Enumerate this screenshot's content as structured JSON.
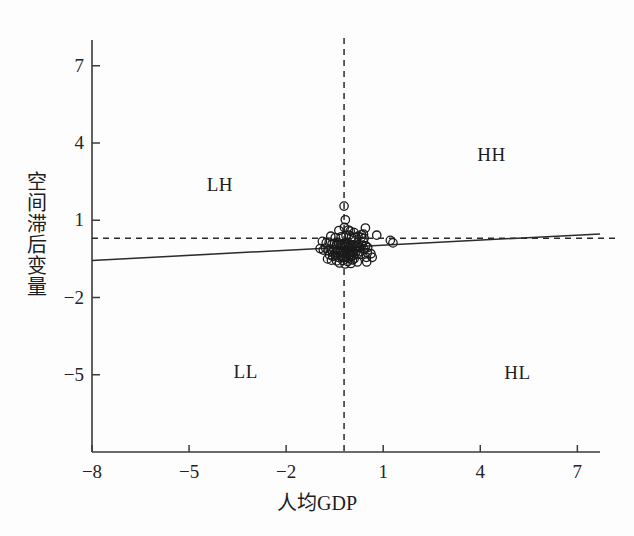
{
  "figure": {
    "background_color": "#fdfdfd",
    "axis_color": "#3a3a3a",
    "point_color": "#1a1a1a",
    "fit_line_color": "#2b2b2b",
    "mean_line_color": "#2b2b2b"
  },
  "chart_data": {
    "type": "scatter",
    "title": "",
    "xlabel": "人均GDP",
    "ylabel": "空间滞后变量",
    "xlim": [
      -8.0,
      7.7
    ],
    "ylim": [
      -8.0,
      8.0
    ],
    "xticks": [
      -8,
      -5,
      -2,
      1,
      4,
      7
    ],
    "xticklabels": [
      "−8",
      "−5",
      "−2",
      "1",
      "4",
      "7"
    ],
    "yticks": [
      7,
      4,
      1,
      -2,
      -5
    ],
    "yticklabels": [
      "7",
      "4",
      "1",
      "−2",
      "−5"
    ],
    "grid": false,
    "legend": null,
    "annotations": [
      {
        "text": "LH",
        "x": -4.05,
        "y": 2.38,
        "name": "quadrant-label-lh"
      },
      {
        "text": "HH",
        "x": 4.35,
        "y": 3.52,
        "name": "quadrant-label-hh"
      },
      {
        "text": "LL",
        "x": -3.25,
        "y": -4.88,
        "name": "quadrant-label-ll"
      },
      {
        "text": "HL",
        "x": 5.15,
        "y": -4.95,
        "name": "quadrant-label-hl"
      }
    ],
    "reference_lines": [
      {
        "orientation": "vertical",
        "value": -0.21,
        "style": "dashed",
        "name": "mean-x-line"
      },
      {
        "orientation": "horizontal",
        "value": 0.3,
        "style": "dashed",
        "name": "mean-y-line"
      }
    ],
    "fit_line": {
      "style": "solid",
      "x": [
        -8.0,
        7.7
      ],
      "y": [
        -0.56,
        0.47
      ],
      "slope": 0.0656,
      "intercept": -0.035
    },
    "marker": {
      "shape": "circle-open",
      "radius_px": 4.2,
      "edge_width_px": 1.3
    },
    "points": [
      [
        -0.21,
        1.55
      ],
      [
        -0.17,
        1.02
      ],
      [
        -0.2,
        0.72
      ],
      [
        -0.37,
        0.6
      ],
      [
        -0.08,
        0.62
      ],
      [
        -0.02,
        0.58
      ],
      [
        0.1,
        0.52
      ],
      [
        0.45,
        0.7
      ],
      [
        0.39,
        0.46
      ],
      [
        0.33,
        0.44
      ],
      [
        -0.62,
        0.38
      ],
      [
        -0.48,
        0.33
      ],
      [
        -0.3,
        0.36
      ],
      [
        -0.15,
        0.4
      ],
      [
        -0.05,
        0.42
      ],
      [
        0.02,
        0.35
      ],
      [
        0.12,
        0.33
      ],
      [
        0.22,
        0.38
      ],
      [
        0.32,
        0.34
      ],
      [
        0.41,
        0.3
      ],
      [
        0.8,
        0.42
      ],
      [
        1.22,
        0.22
      ],
      [
        1.3,
        0.12
      ],
      [
        -0.88,
        0.18
      ],
      [
        -0.76,
        0.12
      ],
      [
        -0.67,
        0.14
      ],
      [
        -0.58,
        0.08
      ],
      [
        -0.5,
        0.1
      ],
      [
        -0.44,
        0.05
      ],
      [
        -0.38,
        0.12
      ],
      [
        -0.33,
        0.02
      ],
      [
        -0.28,
        0.08
      ],
      [
        -0.24,
        0.0
      ],
      [
        -0.2,
        0.1
      ],
      [
        -0.16,
        0.04
      ],
      [
        -0.12,
        -0.02
      ],
      [
        -0.08,
        0.06
      ],
      [
        -0.04,
        -0.04
      ],
      [
        0.0,
        0.02
      ],
      [
        0.05,
        -0.06
      ],
      [
        0.09,
        0.04
      ],
      [
        0.14,
        -0.02
      ],
      [
        0.18,
        -0.08
      ],
      [
        0.23,
        0.0
      ],
      [
        0.28,
        -0.05
      ],
      [
        0.34,
        0.03
      ],
      [
        0.4,
        -0.1
      ],
      [
        0.46,
        0.01
      ],
      [
        0.52,
        -0.06
      ],
      [
        0.38,
        0.18
      ],
      [
        -0.95,
        -0.1
      ],
      [
        -0.85,
        -0.16
      ],
      [
        -0.78,
        -0.08
      ],
      [
        -0.7,
        -0.18
      ],
      [
        -0.64,
        -0.12
      ],
      [
        -0.57,
        -0.22
      ],
      [
        -0.52,
        -0.14
      ],
      [
        -0.46,
        -0.24
      ],
      [
        -0.41,
        -0.16
      ],
      [
        -0.36,
        -0.26
      ],
      [
        -0.31,
        -0.18
      ],
      [
        -0.26,
        -0.28
      ],
      [
        -0.22,
        -0.2
      ],
      [
        -0.18,
        -0.3
      ],
      [
        -0.13,
        -0.22
      ],
      [
        -0.09,
        -0.32
      ],
      [
        -0.05,
        -0.24
      ],
      [
        -0.01,
        -0.34
      ],
      [
        0.04,
        -0.26
      ],
      [
        0.08,
        -0.36
      ],
      [
        0.13,
        -0.28
      ],
      [
        0.17,
        -0.2
      ],
      [
        0.21,
        -0.3
      ],
      [
        0.26,
        -0.22
      ],
      [
        0.31,
        -0.32
      ],
      [
        -0.66,
        -0.34
      ],
      [
        -0.56,
        -0.4
      ],
      [
        -0.47,
        -0.36
      ],
      [
        -0.39,
        -0.44
      ],
      [
        -0.3,
        -0.38
      ],
      [
        -0.23,
        -0.46
      ],
      [
        -0.15,
        -0.4
      ],
      [
        -0.07,
        -0.48
      ],
      [
        0.01,
        -0.42
      ],
      [
        0.1,
        -0.5
      ],
      [
        0.48,
        -0.44
      ],
      [
        0.49,
        -0.62
      ],
      [
        0.51,
        -0.26
      ],
      [
        -0.72,
        -0.5
      ],
      [
        -0.6,
        -0.55
      ],
      [
        -0.44,
        -0.58
      ],
      [
        -0.25,
        -0.56
      ],
      [
        -0.1,
        -0.6
      ],
      [
        0.05,
        -0.54
      ],
      [
        0.2,
        -0.62
      ],
      [
        -0.35,
        -0.66
      ],
      [
        -0.18,
        -0.7
      ],
      [
        0.0,
        -0.68
      ],
      [
        0.62,
        -0.3
      ],
      [
        0.66,
        -0.44
      ]
    ]
  }
}
